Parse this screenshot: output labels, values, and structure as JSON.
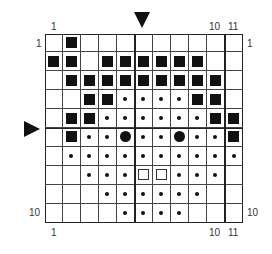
{
  "chart": {
    "columns": 11,
    "rows": 10,
    "labels": {
      "top_left": "1",
      "top_10": "10",
      "top_11": "11",
      "left_1": "1",
      "right_1": "1",
      "left_10": "10",
      "right_10": "10",
      "bottom_left": "1",
      "bottom_10": "10",
      "bottom_11": "11"
    },
    "symbols_legend": {
      "S": "filled-square",
      "d": "small-dot",
      "D": "large-dot",
      "O": "hollow-square",
      ".": "empty"
    },
    "grid": [
      ".S.........",
      "SS.SSSSSS..",
      ".SSSSSSSSS.",
      "..SSddddSS.",
      ".SSddddddSS",
      ".SddDddDddS",
      ".dddddddddd",
      "..dddOOddd.",
      "...dddddd..",
      "....dddd..."
    ],
    "center_markers": {
      "top_arrow_column": 6,
      "left_arrow_row": 6
    }
  }
}
